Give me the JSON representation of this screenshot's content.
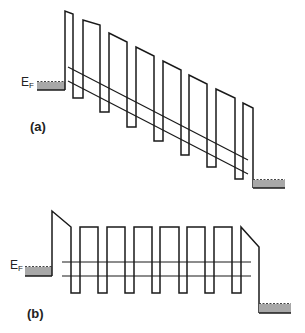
{
  "diagram": {
    "type": "band-diagram",
    "colors": {
      "stroke": "#1a1a1a",
      "electrode_fill": "#a8a8a8"
    },
    "panels": [
      {
        "id": "a",
        "label": "(a)",
        "fermi_label": {
          "main": "E",
          "sub": "F"
        },
        "description": "Biased superlattice: tilted square barriers between two electrodes"
      },
      {
        "id": "b",
        "label": "(b)",
        "fermi_label": {
          "main": "E",
          "sub": "F"
        },
        "description": "Superlattice with flat square barriers, voltage dropped across end barriers"
      }
    ]
  }
}
